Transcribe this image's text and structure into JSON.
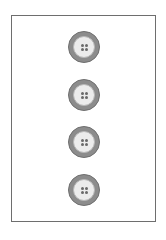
{
  "illustration": {
    "subject": "four sewing buttons in a vertical column",
    "frame": {
      "border_color": "#6e6e6e",
      "background": "#ffffff"
    },
    "buttons": [
      {
        "icon": "sewing-button-icon",
        "holes": 4
      },
      {
        "icon": "sewing-button-icon",
        "holes": 4
      },
      {
        "icon": "sewing-button-icon",
        "holes": 4
      },
      {
        "icon": "sewing-button-icon",
        "holes": 4
      }
    ],
    "colors": {
      "rim": "#8c8c8c",
      "face": "#ececec",
      "holes": "#6a6a6a"
    }
  }
}
